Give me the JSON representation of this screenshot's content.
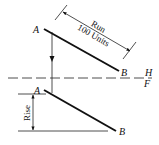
{
  "diagram": {
    "top_view": {
      "point_a_label": "A",
      "point_b_label": "B",
      "run_label": "Run",
      "run_value": "100 Units"
    },
    "fold_line": {
      "upper_label": "H",
      "lower_label": "F"
    },
    "front_view": {
      "point_a_label": "A",
      "point_b_label": "B",
      "rise_label": "Rise"
    }
  }
}
